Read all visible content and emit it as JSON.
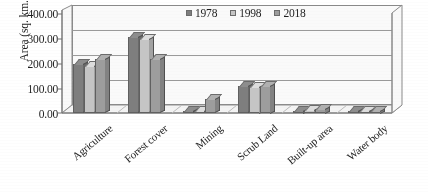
{
  "chart_data": {
    "type": "bar",
    "title": "",
    "subtitle": "",
    "xlabel": "",
    "ylabel": "Area (sq. km.)",
    "ylim": [
      0,
      400
    ],
    "ytick_labels": [
      "400.00",
      "300.00",
      "200.00",
      "100.00",
      "0.00"
    ],
    "ytick_values": [
      400,
      300,
      200,
      100,
      0
    ],
    "grid": true,
    "legend_position": "top-right",
    "categories": [
      "Agriculture",
      "Forest cover",
      "Mining",
      "Scrub Land",
      "Built-up area",
      "Water body"
    ],
    "series": [
      {
        "name": "1978",
        "color": "#7d7d7d",
        "values": [
          195,
          305,
          5,
          108,
          10,
          8
        ]
      },
      {
        "name": "1998",
        "color": "#c6c6c6",
        "values": [
          188,
          295,
          8,
          106,
          12,
          8
        ]
      },
      {
        "name": "2018",
        "color": "#9d9d9d",
        "values": [
          215,
          215,
          55,
          110,
          18,
          10
        ]
      }
    ]
  },
  "legend": {
    "items": [
      {
        "label": "1978",
        "color": "#7d7d7d"
      },
      {
        "label": "1998",
        "color": "#c6c6c6"
      },
      {
        "label": "2018",
        "color": "#9d9d9d"
      }
    ]
  },
  "axes": {
    "y_title": "Area (sq. km.)"
  }
}
